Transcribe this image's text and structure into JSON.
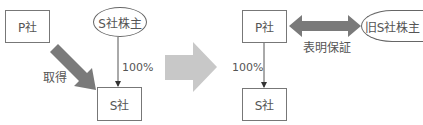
{
  "before": {
    "parent": "P社",
    "target": "S社",
    "shareholders": "S社株主",
    "acquire_label": "取得",
    "ownership_label": "100%"
  },
  "after": {
    "parent": "P社",
    "subsidiary": "S社",
    "former_shareholders": "旧S社株主",
    "ownership_label": "100%",
    "warranty_label": "表明保証"
  },
  "colors": {
    "arrow_dark": "#7a7a7a",
    "arrow_light": "#c8c8c8",
    "line": "#555555"
  }
}
